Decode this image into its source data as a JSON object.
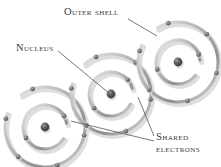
{
  "diagram": {
    "title_labels": {
      "outer_shell": "Outer shell",
      "nucleus": "Nucleus",
      "shared_electrons_line1": "Shared",
      "shared_electrons_line2": "electrons"
    },
    "colors": {
      "background": "#ffffff",
      "text": "#3a3a3a",
      "ring_stroke": "#9b9b9b",
      "ring_shadow": "#d8d8d8",
      "electron": "#6e6e6e",
      "nucleus_core": "#4a4a4a",
      "nucleus_highlight": "#a8a8a8",
      "leader_line": "#555555"
    },
    "atoms": [
      {
        "name": "atom-left",
        "cx": 45,
        "cy": 127,
        "inner_radius": 22,
        "outer_radius": 40,
        "inner_electrons": 2,
        "outer_electrons": 6
      },
      {
        "name": "atom-middle",
        "cx": 111,
        "cy": 94,
        "inner_radius": 22,
        "outer_radius": 40,
        "inner_electrons": 2,
        "outer_electrons": 6
      },
      {
        "name": "atom-right",
        "cx": 178,
        "cy": 62,
        "inner_radius": 22,
        "outer_radius": 40,
        "inner_electrons": 2,
        "outer_electrons": 6
      }
    ],
    "leaders": [
      {
        "name": "leader-outer-shell",
        "x1": 128,
        "y1": 19,
        "x2": 157,
        "y2": 36
      },
      {
        "name": "leader-nucleus",
        "x1": 58,
        "y1": 51,
        "x2": 110,
        "y2": 94
      },
      {
        "name": "leader-shared-a",
        "x1": 154,
        "y1": 136,
        "x2": 138,
        "y2": 97
      },
      {
        "name": "leader-shared-b",
        "x1": 154,
        "y1": 141,
        "x2": 71,
        "y2": 121
      }
    ]
  }
}
